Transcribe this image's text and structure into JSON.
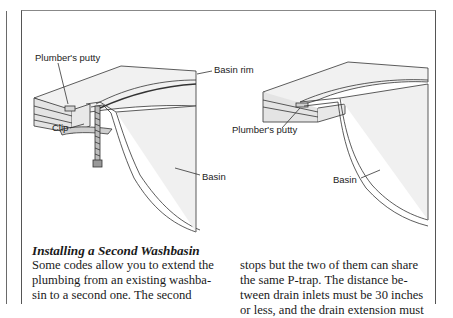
{
  "figure": {
    "left_diagram": {
      "labels": {
        "putty": "Plumber's putty",
        "rim": "Basin rim",
        "clip": "Clip",
        "basin": "Basin"
      }
    },
    "right_diagram": {
      "labels": {
        "putty": "Plumber's putty",
        "basin": "Basin"
      }
    },
    "colors": {
      "fill": "#eeeeee",
      "stroke": "#333333",
      "frame": "#555555"
    }
  },
  "article": {
    "heading": "Installing a Second Washbasin",
    "col1_lines": [
      "Some codes allow you to extend the",
      "plumbing from an existing washba-",
      "sin to a second one. The second"
    ],
    "col2_lines": [
      "stops but the two of them can share",
      "the same P-trap. The distance be-",
      "tween drain inlets must be 30 inches",
      "or less, and the drain extension must"
    ]
  }
}
